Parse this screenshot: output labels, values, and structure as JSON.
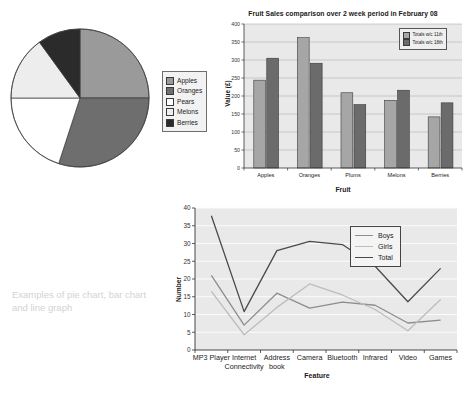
{
  "caption": "Examples of pie chart, bar chart and line graph",
  "pie": {
    "legend_items": [
      "Apples",
      "Oranges",
      "Pears",
      "Melons",
      "Berries"
    ],
    "legend_colors": [
      "#9a9a9a",
      "#6e6e6e",
      "#ffffff",
      "#ededed",
      "#2b2b2b"
    ]
  },
  "bar": {
    "ylabel": "Value (£)",
    "xlabel": "Fruit",
    "legend_items": [
      "Totals w/c 11th",
      "Totals w/c 18th"
    ],
    "legend_colors": [
      "#a6a6a6",
      "#6b6b6b"
    ]
  },
  "line": {
    "ylabel": "Number",
    "xlabel": "Feature",
    "legend_items": [
      "Boys",
      "Girls",
      "Total"
    ],
    "legend_colors": [
      "#8d8d8d",
      "#bdbdbd",
      "#4a4a4a"
    ]
  },
  "chart_data": [
    {
      "type": "pie",
      "title": "",
      "categories": [
        "Apples",
        "Oranges",
        "Pears",
        "Melons",
        "Berries"
      ],
      "values": [
        25,
        30,
        20,
        15,
        10
      ],
      "unit": "percent",
      "colors": [
        "#9a9a9a",
        "#6e6e6e",
        "#ffffff",
        "#ededed",
        "#2b2b2b"
      ],
      "start_angle_deg": 0,
      "legend_position": "right"
    },
    {
      "type": "bar",
      "title": "Fruit Sales comparison over 2 week period in February 08",
      "xlabel": "Fruit",
      "ylabel": "Value (£)",
      "categories": [
        "Apples",
        "Oranges",
        "Plums",
        "Melons",
        "Berries"
      ],
      "series": [
        {
          "name": "Totals w/c 11th",
          "values": [
            244,
            362,
            209,
            188,
            142
          ],
          "color": "#a6a6a6"
        },
        {
          "name": "Totals w/c 18th",
          "values": [
            305,
            291,
            176,
            216,
            181
          ],
          "color": "#6b6b6b"
        }
      ],
      "ylim": [
        0,
        400
      ],
      "yticks": [
        0,
        50,
        100,
        150,
        200,
        250,
        300,
        350,
        400
      ],
      "grid": true,
      "legend_position": "top-right"
    },
    {
      "type": "line",
      "title": "",
      "xlabel": "Feature",
      "ylabel": "Number",
      "categories": [
        "MP3 Player",
        "Internet Connectivity",
        "Address book",
        "Camera",
        "Bluetooth",
        "Infrared",
        "Video",
        "Games"
      ],
      "series": [
        {
          "name": "Boys",
          "values": [
            21,
            7,
            16,
            11.8,
            13.5,
            12.6,
            7.6,
            8.4
          ],
          "color": "#8d8d8d"
        },
        {
          "name": "Girls",
          "values": [
            16.5,
            4.3,
            12,
            18.6,
            15.5,
            11.4,
            5.4,
            14.2
          ],
          "color": "#bdbdbd"
        },
        {
          "name": "Total",
          "values": [
            37.8,
            10.8,
            28,
            30.6,
            29.7,
            23.6,
            13.6,
            23
          ],
          "color": "#4a4a4a"
        }
      ],
      "ylim": [
        0,
        40
      ],
      "yticks": [
        0,
        5,
        10,
        15,
        20,
        25,
        30,
        35,
        40
      ],
      "grid": true,
      "legend_position": "top-right"
    }
  ]
}
